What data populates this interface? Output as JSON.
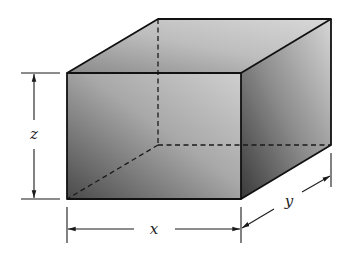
{
  "figure": {
    "type": "rectangular-box-diagram",
    "labels": {
      "x": "x",
      "y": "y",
      "z": "z"
    },
    "colors": {
      "stroke": "#1a1a1a",
      "shade_dark": "#555555",
      "shade_light": "#d4d4d4",
      "background": "#ffffff"
    }
  }
}
